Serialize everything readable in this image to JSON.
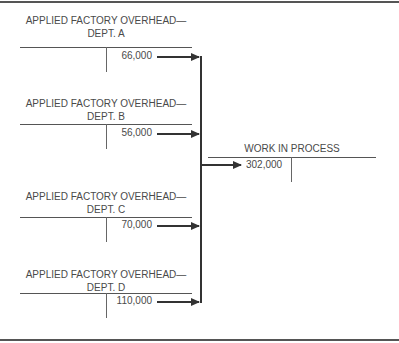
{
  "diagram": {
    "accounts": [
      {
        "title_line1": "APPLIED FACTORY OVERHEAD—",
        "title_line2": "DEPT. A",
        "credit": "66,000"
      },
      {
        "title_line1": "APPLIED FACTORY OVERHEAD—",
        "title_line2": "DEPT. B",
        "credit": "56,000"
      },
      {
        "title_line1": "APPLIED FACTORY OVERHEAD—",
        "title_line2": "DEPT. C",
        "credit": "70,000"
      },
      {
        "title_line1": "APPLIED FACTORY OVERHEAD—",
        "title_line2": "DEPT. D",
        "credit": "110,000"
      }
    ],
    "target": {
      "title": "WORK IN PROCESS",
      "debit": "302,000"
    },
    "colors": {
      "line": "#555555",
      "arrow": "#333333",
      "text": "#4a4a4a"
    }
  }
}
